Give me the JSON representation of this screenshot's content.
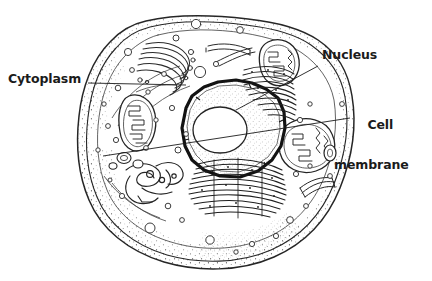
{
  "diagram": {
    "background_color": "#ffffff",
    "ink_color": "#1b1b1b",
    "line_color": "#3a3a3a",
    "labels": [
      {
        "id": "cytoplasm",
        "text": "Cytoplasm",
        "lines": [
          "Cytoplasm"
        ],
        "position": "left",
        "leader": {
          "x1": 88,
          "y1": 83,
          "x2": 186,
          "y2": 85
        }
      },
      {
        "id": "nucleus",
        "text": "Nucleus",
        "lines": [
          "Nucleus"
        ],
        "position": "top-right",
        "leader": {
          "x1": 318,
          "y1": 66,
          "x2": 236,
          "y2": 110
        }
      },
      {
        "id": "cell-membrane",
        "text": "Cell membrane",
        "lines": [
          "Cell",
          "membrane"
        ],
        "position": "right",
        "leader": {
          "x1": 350,
          "y1": 118,
          "x2": 103,
          "y2": 156
        }
      }
    ],
    "structures": [
      {
        "name": "cell-membrane",
        "description": "outer double-line boundary of the cell"
      },
      {
        "name": "cytoplasm",
        "description": "stippled region filling the cell interior"
      },
      {
        "name": "nucleus",
        "description": "large central organelle with thick dark envelope"
      },
      {
        "name": "nucleolus",
        "description": "white oval body inside the nucleus"
      },
      {
        "name": "mitochondrion-left",
        "description": "bean-shaped organelle with cristae, upper left"
      },
      {
        "name": "mitochondrion-right",
        "description": "bean-shaped organelle with cristae, right side"
      },
      {
        "name": "mitochondrion-top-right",
        "description": "bean-shaped organelle with cristae, top right"
      },
      {
        "name": "golgi-apparatus",
        "description": "stacked curved membranes, upper left"
      },
      {
        "name": "rough-endoplasmic-reticulum",
        "description": "dense stacked membranes below the nucleus"
      },
      {
        "name": "smooth-endoplasmic-reticulum",
        "description": "tubular network at lower left"
      },
      {
        "name": "vesicles",
        "description": "small circular bodies scattered in the cytoplasm"
      }
    ]
  }
}
